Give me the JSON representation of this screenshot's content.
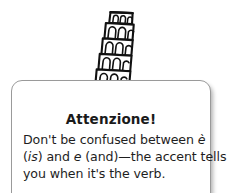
{
  "callout": {
    "kind": "attenzione-note",
    "icon_names": {
      "tower": "leaning-tower-of-pisa-icon",
      "dot": "exclamation-dot-icon"
    },
    "heading": "Attenzione!",
    "body_lines": [
      {
        "pre": "Don't be confused between ",
        "em": "è",
        "post": ""
      },
      {
        "pre": "(",
        "em": "is",
        "post": ") and "
      },
      {
        "pre": "",
        "em": "e",
        "post": " (and)—the accent tells"
      },
      {
        "pre": "you when it's the verb.",
        "em": "",
        "post": ""
      }
    ],
    "body_text": "Don't be confused between è (is) and e (and)—the accent tells you when it's the verb.",
    "line1_pre": "Don't be confused between ",
    "line1_em": "è",
    "line2_a": "(",
    "line2_em1": "is",
    "line2_b": ") and ",
    "line2_em2": "e",
    "line2_c": " (and)—the accent tells",
    "line3": "you when it's the verb.",
    "colors": {
      "card_border": "#9a9a9a",
      "card_background": "#ffffff",
      "ink": "#1a1a1a",
      "page_background": "#ffffff"
    }
  }
}
